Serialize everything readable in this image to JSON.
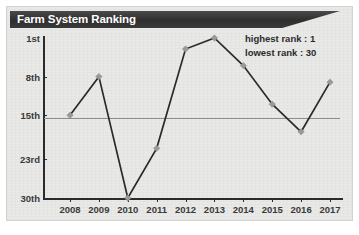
{
  "header": {
    "title": "Farm System Ranking"
  },
  "legend": {
    "highest_label": "highest rank : 1",
    "lowest_label": "lowest rank : 30"
  },
  "style": {
    "banner_color": "#2e2e2e",
    "panel_color": "#e9e9e7",
    "line_color": "#2b2b2b",
    "marker_color": "#9a9a9a",
    "refline_color": "#8d8d8b"
  },
  "chart_data": {
    "type": "line",
    "title": "Farm System Ranking",
    "xlabel": "",
    "ylabel": "",
    "x": [
      2008,
      2009,
      2010,
      2011,
      2012,
      2013,
      2014,
      2015,
      2016,
      2017
    ],
    "categories": [
      "2008",
      "2009",
      "2010",
      "2011",
      "2012",
      "2013",
      "2014",
      "2015",
      "2016",
      "2017"
    ],
    "values": [
      15,
      8,
      30,
      21,
      3,
      1,
      6,
      13,
      18,
      9
    ],
    "series": [
      {
        "name": "Farm system rank",
        "values": [
          15,
          8,
          30,
          21,
          3,
          1,
          6,
          13,
          18,
          9
        ]
      }
    ],
    "ytick_labels": [
      "1st",
      "8th",
      "15th",
      "23rd",
      "30th"
    ],
    "ytick_values": [
      1,
      8,
      15,
      23,
      30
    ],
    "xtick_labels": [
      "2008",
      "2009",
      "2010",
      "2011",
      "2012",
      "2013",
      "2014",
      "2015",
      "2016",
      "2017"
    ],
    "ylim": [
      1,
      30
    ],
    "y_inverted": true,
    "grid": false,
    "reference_line": 15,
    "legend_position": "top-right",
    "annotations": [
      "highest rank : 1",
      "lowest rank : 30"
    ],
    "marker": "diamond"
  }
}
